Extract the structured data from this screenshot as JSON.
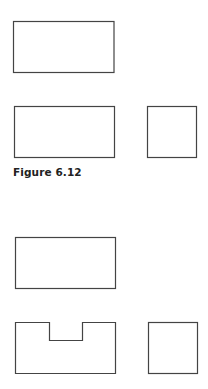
{
  "figure_top": {
    "caption": "Figure 6.12",
    "views": [
      "top-view-rectangle",
      "front-view-rectangle",
      "side-view-square"
    ]
  },
  "figure_bottom": {
    "views": [
      "top-view-rectangle",
      "front-view-notched",
      "side-view-square"
    ]
  },
  "colors": {
    "stroke": "#444444",
    "background": "#ffffff"
  }
}
